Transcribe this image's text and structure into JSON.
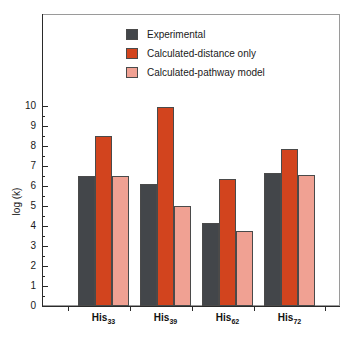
{
  "chart_data": {
    "type": "bar",
    "title": "",
    "xlabel": "",
    "ylabel": "log (k)",
    "ylim": [
      0,
      10
    ],
    "ytick_step": 1,
    "minor_ticks": true,
    "grid": false,
    "legend_position": "top-center",
    "categories": [
      "His33",
      "His39",
      "His62",
      "His72"
    ],
    "category_labels": [
      {
        "base": "His",
        "sub": "33"
      },
      {
        "base": "His",
        "sub": "39"
      },
      {
        "base": "His",
        "sub": "62"
      },
      {
        "base": "His",
        "sub": "72"
      }
    ],
    "ytick_labels": [
      "0",
      "1",
      "2",
      "3",
      "4",
      "5",
      "6",
      "7",
      "8",
      "9",
      "10"
    ],
    "series": [
      {
        "name": "Experimental",
        "color": "#43464a",
        "values": [
          6.5,
          6.1,
          4.15,
          6.65
        ]
      },
      {
        "name": "Calculated-distance only",
        "color": "#d2441e",
        "values": [
          8.5,
          9.95,
          6.35,
          7.85
        ]
      },
      {
        "name": "Calculated-pathway model",
        "color": "#f0a193",
        "values": [
          6.5,
          5.0,
          3.75,
          6.55
        ]
      }
    ]
  },
  "legend": {
    "items": [
      {
        "label": "Experimental",
        "color": "#43464a"
      },
      {
        "label": "Calculated-distance only",
        "color": "#d2441e"
      },
      {
        "label": "Calculated-pathway model",
        "color": "#f0a193"
      }
    ]
  },
  "axes": {
    "y_title": "log (k)"
  }
}
